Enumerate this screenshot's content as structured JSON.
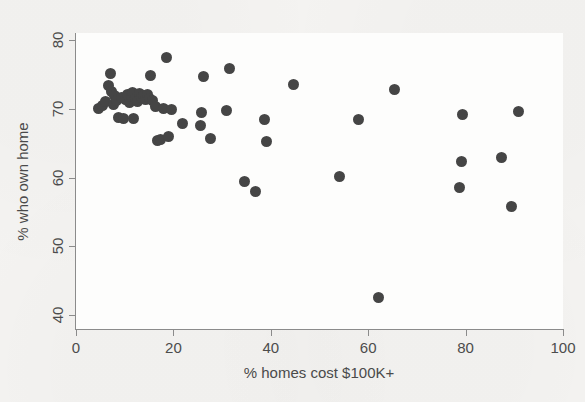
{
  "figure": {
    "background_color": "#f4f3f1",
    "plot_background_color": "#fdfdfc",
    "axis_color": "#8b8b8b",
    "marker_color": "#454545"
  },
  "chart_data": {
    "type": "scatter",
    "title": "",
    "xlabel": "% homes cost $100K+",
    "ylabel": "% who own home",
    "xlim": [
      0,
      100
    ],
    "ylim": [
      38,
      81
    ],
    "xticks": [
      0,
      20,
      40,
      60,
      80,
      100
    ],
    "yticks": [
      40,
      50,
      60,
      70,
      80
    ],
    "grid": false,
    "legend": null,
    "marker": "filled-circle",
    "series": [
      {
        "name": "states",
        "points": [
          [
            4.6,
            70.1
          ],
          [
            5.4,
            70.4
          ],
          [
            6.1,
            71.0
          ],
          [
            6.6,
            73.4
          ],
          [
            7.0,
            75.1
          ],
          [
            7.2,
            72.5
          ],
          [
            7.6,
            70.6
          ],
          [
            8.0,
            71.9
          ],
          [
            8.4,
            71.2
          ],
          [
            8.8,
            68.7
          ],
          [
            9.4,
            71.6
          ],
          [
            9.8,
            68.6
          ],
          [
            10.2,
            71.4
          ],
          [
            10.6,
            72.0
          ],
          [
            11.0,
            70.9
          ],
          [
            11.3,
            71.8
          ],
          [
            11.6,
            72.3
          ],
          [
            11.9,
            68.6
          ],
          [
            12.2,
            71.5
          ],
          [
            12.6,
            71.1
          ],
          [
            13.0,
            72.2
          ],
          [
            13.4,
            71.6
          ],
          [
            13.8,
            71.9
          ],
          [
            14.2,
            71.4
          ],
          [
            14.6,
            72.0
          ],
          [
            15.0,
            71.5
          ],
          [
            15.4,
            74.8
          ],
          [
            15.8,
            71.2
          ],
          [
            16.3,
            70.3
          ],
          [
            16.8,
            65.4
          ],
          [
            17.4,
            65.5
          ],
          [
            18.0,
            70.0
          ],
          [
            18.6,
            77.4
          ],
          [
            19.0,
            65.9
          ],
          [
            19.6,
            69.9
          ],
          [
            21.8,
            67.8
          ],
          [
            25.5,
            67.6
          ],
          [
            25.8,
            69.5
          ],
          [
            26.2,
            74.7
          ],
          [
            27.6,
            65.7
          ],
          [
            31.0,
            69.7
          ],
          [
            31.6,
            75.9
          ],
          [
            34.7,
            59.4
          ],
          [
            36.8,
            58.0
          ],
          [
            38.8,
            68.4
          ],
          [
            39.1,
            65.3
          ],
          [
            44.6,
            73.5
          ],
          [
            54.2,
            60.2
          ],
          [
            58.0,
            68.4
          ],
          [
            62.2,
            42.6
          ],
          [
            65.3,
            72.8
          ],
          [
            78.8,
            58.5
          ],
          [
            79.2,
            62.3
          ],
          [
            79.3,
            69.1
          ],
          [
            87.4,
            62.9
          ],
          [
            89.4,
            55.8
          ],
          [
            90.8,
            69.6
          ]
        ]
      }
    ]
  }
}
